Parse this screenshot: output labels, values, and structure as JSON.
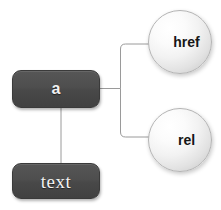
{
  "diagram": {
    "background_color": "#ffffff",
    "edge_color": "#9a9a9a",
    "nodes": [
      {
        "id": "a",
        "label": "a",
        "shape": "rounded-rectangle",
        "fill_color": "#4d4d4d",
        "text_color": "#f2f2f2"
      },
      {
        "id": "text",
        "label": "text",
        "shape": "rounded-rectangle",
        "fill_color": "#4d4d4d",
        "text_color": "#f2f2f2"
      },
      {
        "id": "href",
        "label": "href",
        "shape": "circle",
        "fill_color": "#f4f4f4",
        "text_color": "#161616"
      },
      {
        "id": "rel",
        "label": "rel",
        "shape": "circle",
        "fill_color": "#f4f4f4",
        "text_color": "#161616"
      }
    ],
    "edges": [
      {
        "from": "a",
        "to": "href"
      },
      {
        "from": "a",
        "to": "rel"
      },
      {
        "from": "a",
        "to": "text"
      }
    ]
  }
}
